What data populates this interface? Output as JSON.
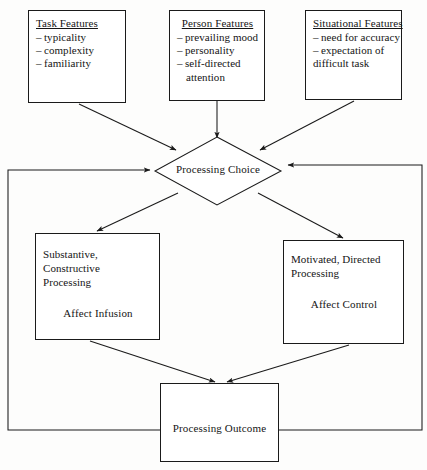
{
  "diagram": {
    "stroke_color": "#1a1a1a",
    "background_color": "#fdfdfc",
    "nodes": {
      "task_features": {
        "title": "Task Features",
        "items": [
          "typicality",
          "complexity",
          "familiarity"
        ]
      },
      "person_features": {
        "title": "Person Features",
        "items": [
          "prevailing mood",
          "personality",
          "self-directed"
        ],
        "continuation": "attention"
      },
      "situational_features": {
        "title": "Situational Features",
        "items": [
          "need for accuracy",
          "expectation of"
        ],
        "continuation": "difficult task"
      },
      "processing_choice": {
        "label": "Processing Choice"
      },
      "substantive_processing": {
        "line1": "Substantive, Constructive",
        "line2": "Processing",
        "emphasis": "Affect Infusion"
      },
      "motivated_processing": {
        "line1": "Motivated, Directed",
        "line2": "Processing",
        "emphasis": "Affect Control"
      },
      "processing_outcome": {
        "label": "Processing Outcome"
      }
    }
  }
}
